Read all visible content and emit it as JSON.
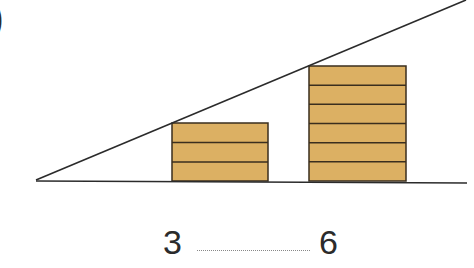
{
  "problem": {
    "marker": ")",
    "left_value": "3",
    "right_value": "6",
    "blank": ""
  },
  "figure": {
    "plank_color": "#dcb063",
    "line_color": "#2b2b2b",
    "stacks": [
      {
        "name": "short-stack",
        "planks": 3
      },
      {
        "name": "tall-stack",
        "planks": 6
      }
    ]
  }
}
